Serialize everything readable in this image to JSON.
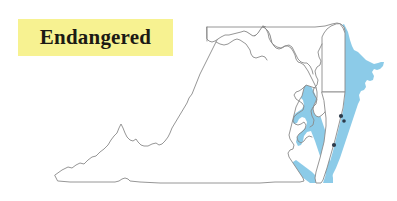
{
  "label": {
    "text": "Endangered",
    "highlight_color": "#f7f291",
    "text_color": "#1c1a14"
  },
  "map": {
    "title": "Endangered",
    "background_color": "#ffffff",
    "outline_color": "#8a8a8a",
    "water_color": "#8ccbe8",
    "marker_color": "#2c3a4a",
    "regions": [
      {
        "name": "Virginia",
        "fill": "#ffffff"
      },
      {
        "name": "Maryland",
        "fill": "#ffffff"
      },
      {
        "name": "Delaware",
        "fill": "#ffffff"
      }
    ],
    "water_features": [
      {
        "name": "Chesapeake Bay",
        "color": "#8ccbe8"
      },
      {
        "name": "Atlantic Coast",
        "color": "#8ccbe8"
      },
      {
        "name": "Delaware Bay",
        "color": "#8ccbe8"
      }
    ],
    "markers": [
      {
        "name": "eastern-shore-site-1"
      },
      {
        "name": "eastern-shore-site-2"
      },
      {
        "name": "eastern-shore-site-3"
      }
    ]
  }
}
